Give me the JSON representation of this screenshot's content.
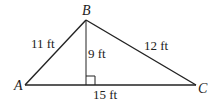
{
  "diagram": {
    "type": "triangle-with-altitude",
    "colors": {
      "stroke": "#222222",
      "background": "#ffffff"
    },
    "vertices": {
      "A": {
        "label": "A",
        "x": 25,
        "y": 85
      },
      "B": {
        "label": "B",
        "x": 86,
        "y": 20
      },
      "C": {
        "label": "C",
        "x": 196,
        "y": 85
      }
    },
    "altitude_foot": {
      "x": 86,
      "y": 85
    },
    "right_angle_marker": true,
    "measurements": {
      "AB": "11 ft",
      "BC": "12 ft",
      "altitude": "9 ft",
      "AC": "15 ft"
    }
  }
}
